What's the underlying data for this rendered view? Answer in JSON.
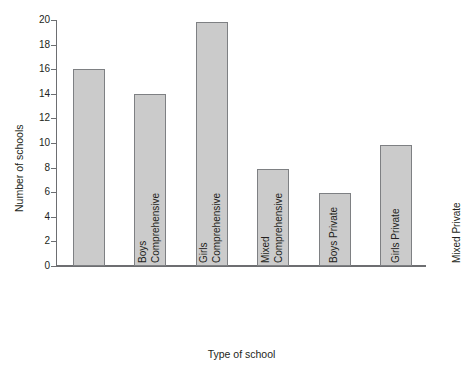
{
  "chart_data": {
    "type": "bar",
    "title": "",
    "xlabel": "Type of school",
    "ylabel": "Number of schools",
    "categories": [
      "Boys Comprehensive",
      "Girls Comprehensive",
      "Mixed Comprehensive",
      "Boys Private",
      "Girls Private",
      "Mixed Private"
    ],
    "category_lines": [
      [
        "Boys",
        "Comprehensive"
      ],
      [
        "Girls",
        "Comprehensive"
      ],
      [
        "Mixed",
        "Comprehensive"
      ],
      [
        "Boys Private",
        ""
      ],
      [
        "Girls Private",
        ""
      ],
      [
        "Mixed Private",
        ""
      ]
    ],
    "values": [
      16,
      14,
      19.8,
      7.9,
      5.9,
      9.8
    ],
    "ylim": [
      0,
      20
    ],
    "yticks": [
      0,
      2,
      4,
      6,
      8,
      10,
      12,
      14,
      16,
      18,
      20
    ],
    "ytick_labels": [
      "0",
      "2",
      "4",
      "6",
      "8",
      "10",
      "12",
      "14",
      "16",
      "18",
      "20"
    ],
    "grid": false,
    "legend": false,
    "bar_fill_color": "#cbcbcb",
    "bar_border_color": "#7e8083",
    "axis_color": "#6d6e71",
    "background_color": "#ffffff"
  }
}
